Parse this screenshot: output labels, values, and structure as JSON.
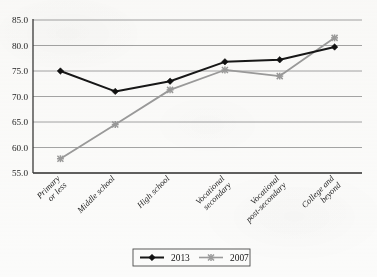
{
  "chart_data": {
    "type": "line",
    "title": "",
    "subtitle": "",
    "xlabel": "",
    "ylabel": "",
    "categories": [
      "Primary or less",
      "Middle school",
      "High school",
      "Vocational secondary",
      "Vocational post-secondary",
      "College and beyond"
    ],
    "category_lines": [
      [
        "Primary",
        "or less"
      ],
      [
        "Middle school"
      ],
      [
        "High school"
      ],
      [
        "Vocational",
        "secondary"
      ],
      [
        "Vocational",
        "post-secondary"
      ],
      [
        "College and",
        "beyond"
      ]
    ],
    "series": [
      {
        "name": "2013",
        "values": [
          75.0,
          71.0,
          73.0,
          76.8,
          77.2,
          79.7
        ],
        "color": "#171717",
        "marker": "diamond"
      },
      {
        "name": "2007",
        "values": [
          57.8,
          64.5,
          71.3,
          75.2,
          74.0,
          81.5
        ],
        "color": "#9a9a9a",
        "marker": "x-cross"
      }
    ],
    "ylim": [
      55.0,
      85.0
    ],
    "ytick_step": 5.0,
    "ytick_labels": [
      "85.0",
      "80.0",
      "75.0",
      "70.0",
      "65.0",
      "60.0",
      "55.0"
    ],
    "ytick_values": [
      85.0,
      80.0,
      75.0,
      70.0,
      65.0,
      60.0,
      55.0
    ],
    "grid": true,
    "grid_axis": "y",
    "legend_position": "bottom",
    "legend_entries": [
      {
        "label": "2013",
        "color": "#171717",
        "marker": "diamond"
      },
      {
        "label": "2007",
        "color": "#9a9a9a",
        "marker": "x-cross"
      }
    ]
  },
  "colors": {
    "series_2013": "#171717",
    "series_2007": "#9a9a9a",
    "gridline": "#8e8e8e",
    "axis": "#3a3a3a",
    "background": "#fbfbfa",
    "text": "#1d1d1d"
  }
}
